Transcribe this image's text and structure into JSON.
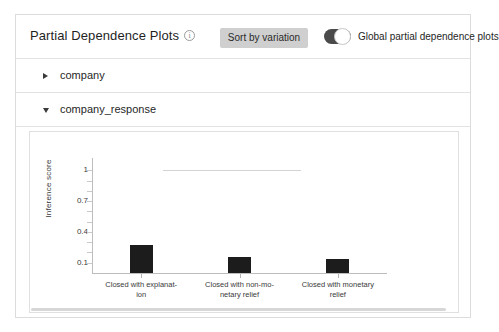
{
  "header": {
    "title": "Partial Dependence Plots",
    "info_icon": "info-icon",
    "sort_button_label": "Sort by variation",
    "toggle_label": "Global partial dependence plots",
    "toggle_state": "on",
    "button_color": "#cfcfcf",
    "toggle_track_color": "#4a4a4a"
  },
  "features": [
    {
      "name": "company",
      "expanded": false,
      "caret": "chevron-right-icon"
    },
    {
      "name": "company_response",
      "expanded": true,
      "caret": "chevron-down-icon"
    }
  ],
  "chart_data": {
    "type": "bar",
    "title": "",
    "xlabel": "",
    "ylabel": "Inference score",
    "categories": [
      "Closed with explanat-ion",
      "Closed with non-mo-netary relief",
      "Closed with monetary relief"
    ],
    "category_lines": [
      [
        "Closed with explanat-",
        "ion"
      ],
      [
        "Closed with non-mo-",
        "netary relief"
      ],
      [
        "Closed with monetary",
        "relief"
      ]
    ],
    "values": [
      0.27,
      0.155,
      0.135
    ],
    "ylim": [
      0.0,
      1.12
    ],
    "yticks": [
      1,
      0.7,
      0.4,
      0.1
    ],
    "ytick_labels": [
      "1",
      "0.7",
      "0.4",
      "0.1"
    ],
    "grid": false,
    "legend": "none",
    "bar_color": "#1c1c1c",
    "reference_line": {
      "value": 1.0,
      "color": "#d3d3d3",
      "x_start_pct": 24,
      "x_end_pct": 71
    }
  }
}
